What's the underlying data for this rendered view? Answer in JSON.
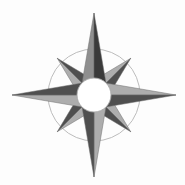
{
  "figure": {
    "name": "compass-rose",
    "title": "Compass Rose",
    "width": 185,
    "height": 185,
    "background_color": "#fdfdfd"
  },
  "geometry": {
    "center_x": 94,
    "center_y": 95,
    "outer_circle_radius": 46,
    "hub_radius": 17,
    "cardinal_point_length": 82,
    "diagonal_point_length": 52,
    "cardinal_half_width": 14,
    "diagonal_half_width": 13
  },
  "colors": {
    "outer_circle_stroke": "#b4b4b4",
    "hub_fill": "#ffffff",
    "hub_stroke": "#a8a8a8",
    "facet_light": "#adadad",
    "facet_mid": "#8f8f8f",
    "facet_dark": "#4f4f4f",
    "facet_darkest": "#3a3a3a",
    "edge_stroke": "#6e6e6e"
  },
  "points": [
    {
      "id": "north",
      "label": "N",
      "abbrev": "N",
      "bearing_degrees": 0,
      "kind": "cardinal",
      "light_facet_color": "#8f8f8f",
      "dark_facet_color": "#3a3a3a",
      "tip_x": 94,
      "tip_y": 13
    },
    {
      "id": "northeast",
      "label": "NE",
      "abbrev": "NE",
      "bearing_degrees": 45,
      "kind": "diagonal",
      "light_facet_color": "#adadad",
      "dark_facet_color": "#4f4f4f",
      "tip_x": 131,
      "tip_y": 58
    },
    {
      "id": "east",
      "label": "E",
      "abbrev": "E",
      "bearing_degrees": 90,
      "kind": "cardinal",
      "light_facet_color": "#adadad",
      "dark_facet_color": "#4f4f4f",
      "tip_x": 176,
      "tip_y": 95
    },
    {
      "id": "southeast",
      "label": "SE",
      "abbrev": "SE",
      "bearing_degrees": 135,
      "kind": "diagonal",
      "light_facet_color": "#adadad",
      "dark_facet_color": "#4f4f4f",
      "tip_x": 131,
      "tip_y": 132
    },
    {
      "id": "south",
      "label": "S",
      "abbrev": "S",
      "bearing_degrees": 180,
      "kind": "cardinal",
      "light_facet_color": "#adadad",
      "dark_facet_color": "#4f4f4f",
      "tip_x": 94,
      "tip_y": 177
    },
    {
      "id": "southwest",
      "label": "SW",
      "abbrev": "SW",
      "bearing_degrees": 225,
      "kind": "diagonal",
      "light_facet_color": "#adadad",
      "dark_facet_color": "#4f4f4f",
      "tip_x": 57,
      "tip_y": 132
    },
    {
      "id": "west",
      "label": "W",
      "abbrev": "W",
      "bearing_degrees": 270,
      "kind": "cardinal",
      "light_facet_color": "#adadad",
      "dark_facet_color": "#4f4f4f",
      "tip_x": 13,
      "tip_y": 95
    },
    {
      "id": "northwest",
      "label": "NW",
      "abbrev": "NW",
      "bearing_degrees": 315,
      "kind": "diagonal",
      "light_facet_color": "#adadad",
      "dark_facet_color": "#4f4f4f",
      "tip_x": 57,
      "tip_y": 58
    }
  ]
}
